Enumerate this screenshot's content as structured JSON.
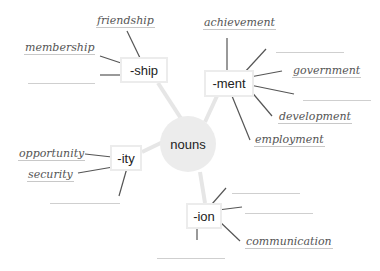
{
  "hub": {
    "label": "nouns"
  },
  "suffixes": [
    {
      "id": "ship",
      "label": "-ship"
    },
    {
      "id": "ment",
      "label": "-ment"
    },
    {
      "id": "ity",
      "label": "-ity"
    },
    {
      "id": "ion",
      "label": "-ion"
    }
  ],
  "words": {
    "ship": [
      "friendship",
      "membership"
    ],
    "ment": [
      "achievement",
      "government",
      "development",
      "employment"
    ],
    "ity": [
      "opportunity",
      "security"
    ],
    "ion": [
      "communication"
    ]
  },
  "colors": {
    "hub_fill": "#ececec",
    "box_border": "#ececec",
    "line": "#555555",
    "connector": "#e6e6e6",
    "blank": "#cfcfcf"
  }
}
